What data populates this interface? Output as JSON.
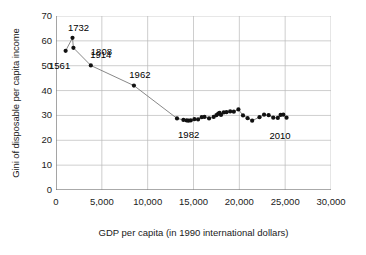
{
  "chart_data": {
    "type": "scatter",
    "title": "",
    "xlabel": "GDP per capita (in 1990 international dollars)",
    "ylabel": "Gini of disposable per capita income",
    "xlim": [
      0,
      30000
    ],
    "ylim": [
      0,
      70
    ],
    "xticks": [
      "0",
      "5,000",
      "10,000",
      "15,000",
      "20,000",
      "25,000",
      "30,000"
    ],
    "xtick_values": [
      0,
      5000,
      10000,
      15000,
      20000,
      25000,
      30000
    ],
    "yticks": [
      "0",
      "10",
      "20",
      "30",
      "40",
      "50",
      "60",
      "70"
    ],
    "ytick_values": [
      0,
      10,
      20,
      30,
      40,
      50,
      60,
      70
    ],
    "grid": true,
    "legend": "none",
    "marker_color": "#111111",
    "line_color": "#7a7a7a",
    "series": [
      {
        "name": "Netherlands inequality vs income",
        "connected": true,
        "points": [
          {
            "x": 1050,
            "y": 56.0,
            "label": "1561"
          },
          {
            "x": 1800,
            "y": 61.2,
            "label": "1732"
          },
          {
            "x": 1900,
            "y": 57.2,
            "label": "1808"
          },
          {
            "x": 3800,
            "y": 50.1,
            "label": "1914"
          },
          {
            "x": 8500,
            "y": 42.0,
            "label": "1962"
          },
          {
            "x": 13200,
            "y": 28.8,
            "label": "1982"
          },
          {
            "x": 13900,
            "y": 28.2,
            "label": ""
          },
          {
            "x": 14250,
            "y": 28.0,
            "label": ""
          },
          {
            "x": 14450,
            "y": 27.9,
            "label": ""
          },
          {
            "x": 14700,
            "y": 28.0,
            "label": ""
          },
          {
            "x": 15100,
            "y": 28.5,
            "label": ""
          },
          {
            "x": 15500,
            "y": 28.4,
            "label": ""
          },
          {
            "x": 15900,
            "y": 29.3,
            "label": ""
          },
          {
            "x": 16200,
            "y": 29.4,
            "label": ""
          },
          {
            "x": 16700,
            "y": 28.8,
            "label": ""
          },
          {
            "x": 17200,
            "y": 29.4,
            "label": ""
          },
          {
            "x": 17500,
            "y": 30.1,
            "label": ""
          },
          {
            "x": 17700,
            "y": 30.7,
            "label": ""
          },
          {
            "x": 17850,
            "y": 31.0,
            "label": ""
          },
          {
            "x": 18000,
            "y": 30.2,
            "label": ""
          },
          {
            "x": 18300,
            "y": 31.2,
            "label": ""
          },
          {
            "x": 18600,
            "y": 31.3,
            "label": ""
          },
          {
            "x": 19000,
            "y": 31.6,
            "label": ""
          },
          {
            "x": 19400,
            "y": 31.5,
            "label": ""
          },
          {
            "x": 19900,
            "y": 32.4,
            "label": ""
          },
          {
            "x": 20400,
            "y": 30.0,
            "label": ""
          },
          {
            "x": 20900,
            "y": 28.9,
            "label": ""
          },
          {
            "x": 21400,
            "y": 27.9,
            "label": ""
          },
          {
            "x": 22200,
            "y": 29.3,
            "label": ""
          },
          {
            "x": 22700,
            "y": 30.3,
            "label": ""
          },
          {
            "x": 23200,
            "y": 30.1,
            "label": ""
          },
          {
            "x": 23700,
            "y": 29.1,
            "label": ""
          },
          {
            "x": 24200,
            "y": 29.0,
            "label": ""
          },
          {
            "x": 24500,
            "y": 30.2,
            "label": ""
          },
          {
            "x": 24800,
            "y": 30.3,
            "label": ""
          },
          {
            "x": 25150,
            "y": 29.1,
            "label": "2010"
          }
        ]
      }
    ],
    "annotations": [
      {
        "text": "1561",
        "x": 1050,
        "y": 56.0,
        "dx": -6,
        "dy": 14
      },
      {
        "text": "1732",
        "x": 1800,
        "y": 61.2,
        "dx": 6,
        "dy": -11
      },
      {
        "text": "1808",
        "x": 1900,
        "y": 57.2,
        "dx": 28,
        "dy": 3
      },
      {
        "text": "1914",
        "x": 3800,
        "y": 50.1,
        "dx": 10,
        "dy": -11
      },
      {
        "text": "1962",
        "x": 8500,
        "y": 42.0,
        "dx": 6,
        "dy": -12
      },
      {
        "text": "1982",
        "x": 13600,
        "y": 28.8,
        "dx": 8,
        "dy": 16
      },
      {
        "text": "2010",
        "x": 24000,
        "y": 29.1,
        "dx": 4,
        "dy": 17
      }
    ]
  }
}
